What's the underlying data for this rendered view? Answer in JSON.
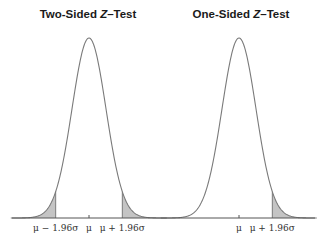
{
  "panels": [
    {
      "title_prefix": "Two-Sided ",
      "title_var": "Z",
      "title_suffix": "–Test",
      "type": "two-sided",
      "labels": [
        "μ − 1.96σ",
        "μ",
        "μ + 1.96σ"
      ]
    },
    {
      "title_prefix": "One-Sided ",
      "title_var": "Z",
      "title_suffix": "–Test",
      "type": "one-sided",
      "labels": [
        "μ",
        "μ + 1.96σ"
      ]
    }
  ],
  "colors": {
    "curve": "#7a7a7a",
    "shade": "#c4c4c4",
    "axis": "#555555"
  },
  "geometry": {
    "baseline_y": 218,
    "peak_y": 38,
    "sigma_px": 17,
    "left_mu_x": 89,
    "right_mu_x": 239,
    "axis_x0": 12,
    "axis_x1": 315
  }
}
